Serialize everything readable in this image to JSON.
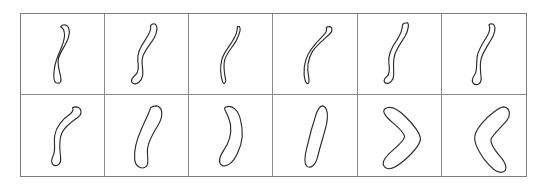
{
  "figure": {
    "title": "",
    "background_color": "#ffffff",
    "border_color": "#7d7d7d",
    "outline_color": "#2b2b2b",
    "grid": {
      "rows": 2,
      "columns": 6,
      "cell_count": 12
    }
  },
  "cells": [
    {
      "index": 1,
      "row": 1,
      "col": 1,
      "label": "",
      "shape": "thin-sinuous-s-curve",
      "outline_path": "M 44 11 C 49 12 50 18 48 24 C 46 31 40 38 38 45 C 36 52 39 58 40 64 C 41 69 40 71 37 71 C 34 71 33 68 33 63 C 33 55 35 48 38 41 C 41 34 44 28 44 22 C 44 17 42 14 40 13 C 41 11 42 11 44 11 Z"
    },
    {
      "index": 2,
      "row": 1,
      "col": 2,
      "label": "",
      "shape": "thin-s-curve",
      "outline_path": "M 50 10 C 54 12 53 18 50 24 C 46 31 40 37 38 44 C 36 51 39 57 38 63 C 37 69 32 73 28 71 C 25 69 27 65 31 62 C 34 59 34 54 33 48 C 32 41 36 33 41 26 C 45 20 47 15 46 12 C 47 10 48 10 50 10 Z"
    },
    {
      "index": 3,
      "row": 1,
      "col": 3,
      "label": "",
      "shape": "thin-narrow-s-curve",
      "outline_path": "M 51 13 C 53 15 51 21 48 27 C 44 34 38 40 36 47 C 34 54 36 62 37 68 C 37 71 35 72 34 70 C 32 64 31 55 33 47 C 35 39 42 32 45 26 C 48 21 49 16 49 13 Z"
    },
    {
      "index": 4,
      "row": 1,
      "col": 4,
      "label": "",
      "shape": "thin-arc-hook",
      "outline_path": "M 57 13 C 60 13 61 17 58 20 C 53 25 45 31 40 38 C 35 46 34 56 36 65 C 37 70 36 72 34 71 C 31 68 30 57 33 47 C 36 37 44 29 50 23 C 54 19 55 16 54 14 C 55 13 56 13 57 13 Z"
    },
    {
      "index": 5,
      "row": 1,
      "col": 5,
      "label": "",
      "shape": "thin-wavy-hook",
      "outline_path": "M 50 9 C 52 10 51 16 48 22 C 44 29 39 35 37 42 C 35 49 36 56 36 62 C 36 68 32 72 28 71 C 25 70 26 66 29 64 C 32 62 32 57 31 50 C 30 42 34 34 39 27 C 43 21 45 15 45 11 C 46 9 48 9 50 9 Z"
    },
    {
      "index": 6,
      "row": 1,
      "col": 6,
      "label": "",
      "shape": "thin-curved-club",
      "outline_path": "M 50 10 C 54 11 54 17 51 23 C 47 31 41 38 39 46 C 37 54 39 61 39 67 C 39 72 34 74 31 71 C 29 69 31 64 33 61 C 35 57 34 50 35 43 C 37 34 43 27 46 21 C 48 17 48 13 47 11 C 48 10 49 10 50 10 Z"
    },
    {
      "index": 7,
      "row": 2,
      "col": 1,
      "label": "",
      "shape": "thick-bent-hook",
      "outline_path": "M 56 12 C 62 13 62 20 57 23 C 51 27 44 32 41 39 C 38 46 39 55 40 63 C 41 69 37 73 33 71 C 30 69 31 64 33 60 C 35 55 33 48 34 41 C 36 31 44 23 50 19 C 53 16 53 14 52 13 C 53 12 54 12 56 12 Z"
    },
    {
      "index": 8,
      "row": 2,
      "col": 2,
      "label": "",
      "shape": "thick-crescent-bean",
      "outline_path": "M 52 11 C 58 12 59 20 55 28 C 50 37 44 45 43 54 C 42 62 45 68 42 72 C 38 76 31 73 30 66 C 29 57 32 45 37 34 C 41 25 45 17 46 13 C 48 11 50 11 52 11 Z"
    },
    {
      "index": 9,
      "row": 2,
      "col": 3,
      "label": "",
      "shape": "thick-reverse-crescent",
      "outline_path": "M 38 12 C 44 10 50 16 52 25 C 55 36 54 49 49 59 C 45 68 38 74 33 71 C 29 68 31 62 35 56 C 40 49 43 40 42 31 C 41 23 37 17 36 14 C 36 12 37 12 38 12 Z"
    },
    {
      "index": 10,
      "row": 2,
      "col": 4,
      "label": "",
      "shape": "thick-slim-oval-blade",
      "outline_path": "M 50 11 C 55 12 56 20 54 30 C 51 42 47 54 45 63 C 43 71 38 75 34 72 C 31 69 32 62 34 54 C 37 41 41 27 44 18 C 46 13 48 11 50 11 Z"
    },
    {
      "index": 11,
      "row": 2,
      "col": 5,
      "label": "",
      "shape": "thick-boomerang-right",
      "outline_path": "M 27 14 C 33 10 40 14 48 22 C 56 30 62 38 63 43 C 64 49 58 56 48 65 C 39 73 31 77 27 73 C 23 69 27 63 35 56 C 42 50 47 45 47 42 C 47 39 42 34 35 28 C 28 22 24 17 27 14 Z"
    },
    {
      "index": 12,
      "row": 2,
      "col": 6,
      "label": "",
      "shape": "thick-boomerang-left",
      "outline_path": "M 62 12 C 68 13 70 20 64 27 C 57 35 50 41 49 45 C 48 49 52 55 58 62 C 65 70 66 76 61 78 C 56 80 49 74 42 65 C 35 55 31 46 33 40 C 35 33 43 24 51 18 C 57 13 60 12 62 12 Z"
    }
  ]
}
